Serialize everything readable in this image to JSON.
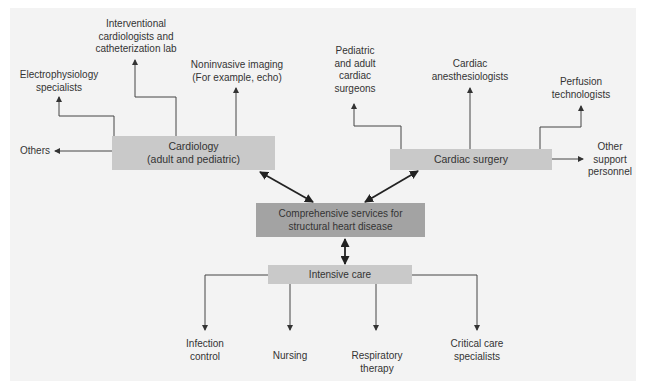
{
  "diagram": {
    "center": {
      "label_line1": "Comprehensive services for",
      "label_line2": "structural heart disease"
    },
    "cardiology": {
      "label_line1": "Cardiology",
      "label_line2": "(adult and pediatric)",
      "branches": [
        {
          "line1": "Electrophysiology",
          "line2": "specialists"
        },
        {
          "line1": "Interventional",
          "line2": "cardiologists and",
          "line3": "catheterization lab"
        },
        {
          "line1": "Noninvasive imaging",
          "line2": "(For example, echo)"
        },
        {
          "line1": "Others"
        }
      ]
    },
    "cardiac_surgery": {
      "label": "Cardiac surgery",
      "branches": [
        {
          "line1": "Pediatric",
          "line2": "and adult",
          "line3": "cardiac",
          "line4": "surgeons"
        },
        {
          "line1": "Cardiac",
          "line2": "anesthesiologists"
        },
        {
          "line1": "Perfusion",
          "line2": "technologists"
        },
        {
          "line1": "Other",
          "line2": "support",
          "line3": "personnel"
        }
      ]
    },
    "intensive_care": {
      "label": "Intensive care",
      "branches": [
        {
          "line1": "Infection",
          "line2": "control"
        },
        {
          "line1": "Nursing"
        },
        {
          "line1": "Respiratory",
          "line2": "therapy"
        },
        {
          "line1": "Critical care",
          "line2": "specialists"
        }
      ]
    },
    "colors": {
      "panel": "#f3f3f3",
      "light_box": "#c9c9c9",
      "dark_box": "#a3a3a3",
      "line": "#333333"
    }
  }
}
